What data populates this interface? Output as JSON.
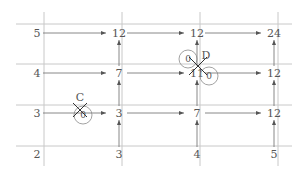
{
  "diagram": {
    "type": "lattice-path-count",
    "grid_lines": {
      "vertical_x": [
        44,
        122,
        200,
        278
      ],
      "horizontal_y": [
        24,
        64,
        105,
        146
      ],
      "v_span": [
        12,
        166
      ],
      "h_span": [
        16,
        292
      ]
    },
    "columns_x": [
      37,
      115,
      193,
      270
    ],
    "rows_y": [
      33,
      73,
      113,
      154
    ],
    "nodes": [
      {
        "id": "r0c0",
        "label": "5",
        "col": 0,
        "row": 0
      },
      {
        "id": "r0c1",
        "label": "12",
        "col": 1,
        "row": 0
      },
      {
        "id": "r0c2",
        "label": "12",
        "col": 2,
        "row": 0
      },
      {
        "id": "r0c3",
        "label": "24",
        "col": 3,
        "row": 0
      },
      {
        "id": "r1c0",
        "label": "4",
        "col": 0,
        "row": 1
      },
      {
        "id": "r1c1",
        "label": "7",
        "col": 1,
        "row": 1
      },
      {
        "id": "r1c2",
        "label": "11",
        "col": 2,
        "row": 1
      },
      {
        "id": "r1c3",
        "label": "12",
        "col": 3,
        "row": 1
      },
      {
        "id": "r2c0",
        "label": "3",
        "col": 0,
        "row": 2
      },
      {
        "id": "r2c1",
        "label": "3",
        "col": 1,
        "row": 2
      },
      {
        "id": "r2c2",
        "label": "7",
        "col": 2,
        "row": 2
      },
      {
        "id": "r2c3",
        "label": "12",
        "col": 3,
        "row": 2
      },
      {
        "id": "r3c0",
        "label": "2",
        "col": 0,
        "row": 3
      },
      {
        "id": "r3c1",
        "label": "3",
        "col": 1,
        "row": 3
      },
      {
        "id": "r3c2",
        "label": "4",
        "col": 2,
        "row": 3
      },
      {
        "id": "r3c3",
        "label": "5",
        "col": 3,
        "row": 3
      }
    ],
    "blocked_points": [
      {
        "name": "C",
        "label": "C",
        "zero_label": "0",
        "x": 80,
        "y": 110,
        "circle_r": 9,
        "circle_cx": 83,
        "circle_cy": 115
      },
      {
        "name": "D",
        "label": "D",
        "zero_labels": [
          "0",
          "0"
        ],
        "x": 198,
        "y": 66,
        "circles": [
          {
            "cx": 188,
            "cy": 59,
            "r": 9
          },
          {
            "cx": 209,
            "cy": 76,
            "r": 9
          }
        ]
      }
    ],
    "colors": {
      "grid": "#c8c8c8",
      "arrow": "#6b6b6b",
      "text": "#555555",
      "circle": "#8a8a8a",
      "cross": "#333333"
    }
  }
}
